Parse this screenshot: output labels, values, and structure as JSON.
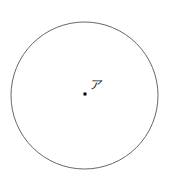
{
  "figure": {
    "type": "geometry-diagram",
    "background_color": "#ffffff",
    "width": 173,
    "height": 188,
    "circle": {
      "name": "circle-outline",
      "center_x": 84.5,
      "center_y": 95.5,
      "radius": 73.5,
      "stroke_color": "#555555",
      "stroke_width": 0.9,
      "fill": "none"
    },
    "center_point": {
      "name": "center-dot",
      "x": 85,
      "y": 94,
      "size": 3,
      "color": "#000000",
      "shape": "square-dot"
    },
    "center_label": {
      "name": "center-point-label",
      "text": "ア",
      "x": 89,
      "y": 79,
      "color": "#1a1a1a",
      "font_size": 12
    }
  }
}
